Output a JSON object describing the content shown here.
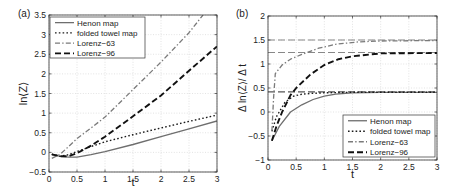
{
  "chart_data": [
    {
      "panel": "(a)",
      "type": "line",
      "xlabel": "t",
      "ylabel": "ln⟨Z⟩",
      "xlim": [
        0,
        3
      ],
      "ylim": [
        -0.5,
        3.5
      ],
      "xticks": [
        0,
        0.5,
        1,
        1.5,
        2,
        2.5,
        3
      ],
      "xtick_labels": [
        "0",
        "0.5",
        "1",
        "1.5",
        "2",
        "2.5",
        "3"
      ],
      "yticks": [
        -0.5,
        0,
        0.5,
        1,
        1.5,
        2,
        2.5,
        3,
        3.5
      ],
      "ytick_labels": [
        "−0.5",
        "0",
        "0.5",
        "1",
        "1.5",
        "2",
        "2.5",
        "3",
        "3.5"
      ],
      "grid": true,
      "legend_position": "upper left",
      "series": [
        {
          "name": "Henon map",
          "style": "solid",
          "color": "#6e6e6e",
          "x": [
            0.05,
            0.2,
            0.35,
            0.5,
            0.75,
            1.0,
            1.5,
            2.0,
            2.5,
            3.0
          ],
          "values": [
            -0.05,
            -0.1,
            -0.12,
            -0.12,
            -0.06,
            0.02,
            0.2,
            0.4,
            0.6,
            0.8
          ]
        },
        {
          "name": "folded towel map",
          "style": "dotted",
          "color": "#1a1a1a",
          "x": [
            0.05,
            0.2,
            0.35,
            0.5,
            0.75,
            1.0,
            1.5,
            2.0,
            2.5,
            3.0
          ],
          "values": [
            -0.05,
            -0.1,
            -0.06,
            0.02,
            0.15,
            0.27,
            0.45,
            0.62,
            0.79,
            0.95
          ]
        },
        {
          "name": "Lorenz−63",
          "style": "dashdot",
          "color": "#7a7a7a",
          "x": [
            0.05,
            0.2,
            0.35,
            0.5,
            0.75,
            1.0,
            1.5,
            2.0,
            2.5,
            2.75
          ],
          "values": [
            -0.15,
            -0.05,
            0.15,
            0.35,
            0.62,
            0.9,
            1.6,
            2.3,
            3.05,
            3.5
          ]
        },
        {
          "name": "Lorenz−96",
          "style": "dashed",
          "color": "#111111",
          "x": [
            0.05,
            0.2,
            0.35,
            0.5,
            0.75,
            1.0,
            1.5,
            2.0,
            2.5,
            3.0
          ],
          "values": [
            -0.05,
            -0.1,
            -0.1,
            -0.02,
            0.17,
            0.4,
            0.92,
            1.45,
            2.08,
            2.7
          ]
        }
      ]
    },
    {
      "panel": "(b)",
      "type": "line",
      "xlabel": "t",
      "ylabel": "Δ ln⟨Z⟩/ Δ t",
      "xlim": [
        0,
        3
      ],
      "ylim": [
        -1,
        2
      ],
      "xticks": [
        0,
        0.5,
        1,
        1.5,
        2,
        2.5,
        3
      ],
      "xtick_labels": [
        "0",
        "0.5",
        "1",
        "1.5",
        "2",
        "2.5",
        "3"
      ],
      "yticks": [
        -1,
        -0.5,
        0,
        0.5,
        1,
        1.5,
        2
      ],
      "ytick_labels": [
        "−1",
        "−0.5",
        "0",
        "0.5",
        "1",
        "1.5",
        "2"
      ],
      "grid": true,
      "legend_position": "lower right",
      "reference_lines": [
        {
          "y": 1.5,
          "style": "dashed",
          "color": "#888888"
        },
        {
          "y": 1.24,
          "style": "dashed",
          "color": "#888888"
        },
        {
          "y": 0.42,
          "style": "dashed",
          "color": "#555555"
        }
      ],
      "series": [
        {
          "name": "Henon map",
          "style": "solid",
          "color": "#6e6e6e",
          "x": [
            0.07,
            0.2,
            0.4,
            0.6,
            0.8,
            1.0,
            1.2,
            1.5,
            2.0,
            3.0
          ],
          "values": [
            -0.6,
            -0.3,
            0.0,
            0.15,
            0.26,
            0.33,
            0.37,
            0.4,
            0.41,
            0.41
          ]
        },
        {
          "name": "folded towel map",
          "style": "dotted",
          "color": "#1a1a1a",
          "x": [
            0.07,
            0.15,
            0.3,
            0.45,
            0.6,
            0.8,
            1.0,
            1.5,
            2.0,
            3.0
          ],
          "values": [
            -0.4,
            -0.1,
            0.2,
            0.33,
            0.37,
            0.39,
            0.4,
            0.41,
            0.41,
            0.41
          ]
        },
        {
          "name": "Lorenz−63",
          "style": "dashdot",
          "color": "#7a7a7a",
          "x": [
            0.07,
            0.1,
            0.13,
            0.25,
            0.4,
            0.6,
            0.9,
            1.2,
            1.6,
            2.0,
            3.0
          ],
          "values": [
            -0.4,
            0.3,
            0.8,
            0.98,
            1.1,
            1.2,
            1.33,
            1.41,
            1.46,
            1.48,
            1.49
          ]
        },
        {
          "name": "Lorenz−96",
          "style": "dashed",
          "color": "#111111",
          "x": [
            0.07,
            0.15,
            0.25,
            0.4,
            0.5,
            0.75,
            1.0,
            1.25,
            1.5,
            2.0,
            3.0
          ],
          "values": [
            -0.6,
            -0.3,
            0.0,
            0.35,
            0.5,
            0.78,
            0.98,
            1.1,
            1.16,
            1.22,
            1.23
          ]
        }
      ]
    }
  ]
}
